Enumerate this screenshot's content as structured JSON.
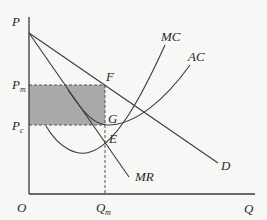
{
  "diagram": {
    "type": "monopoly-price-output",
    "axes": {
      "y_label": "P",
      "x_label": "Q",
      "origin_label": "O"
    },
    "price_levels": [
      {
        "main": "P",
        "sub": "m"
      },
      {
        "main": "P",
        "sub": "c"
      }
    ],
    "quantity_levels": [
      {
        "main": "Q",
        "sub": "m"
      }
    ],
    "curves": [
      {
        "name": "MC",
        "label": "MC"
      },
      {
        "name": "AC",
        "label": "AC"
      },
      {
        "name": "D",
        "label": "D"
      },
      {
        "name": "MR",
        "label": "MR"
      }
    ],
    "points": [
      {
        "name": "F",
        "label": "F"
      },
      {
        "name": "G",
        "label": "G"
      },
      {
        "name": "E",
        "label": "E"
      }
    ],
    "shaded_region": {
      "description": "profit rectangle between Pm and Pc up to Qm",
      "color": "#a9a9a9"
    },
    "colors": {
      "background": "#f7f7f5",
      "lines": "#3a3a3a",
      "shade": "#a9a9a9"
    }
  }
}
